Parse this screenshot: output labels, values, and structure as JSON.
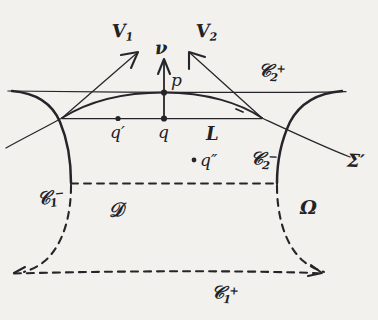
{
  "figure": {
    "kind": "hand-drawn mathematical diagram",
    "background_color": "#f2f1ee",
    "ink_color": "#26262a",
    "width": 378,
    "height": 320
  },
  "vectors": {
    "v1": {
      "label": "V",
      "sub": "1",
      "sup": ""
    },
    "v2": {
      "label": "V",
      "sub": "2",
      "sup": ""
    },
    "nu": {
      "label": "ν",
      "sub": "",
      "sup": ""
    }
  },
  "points": {
    "p": {
      "label": "p",
      "prime": ""
    },
    "q": {
      "label": "q",
      "prime": ""
    },
    "q_prime": {
      "label": "q",
      "prime": "′"
    },
    "q_dprime": {
      "label": "q",
      "prime": "″"
    }
  },
  "curves": {
    "c2_plus": {
      "label": "𝒞",
      "sub": "2",
      "sup": "+"
    },
    "c2_minus": {
      "label": "𝒞",
      "sub": "2",
      "sup": "−"
    },
    "c1_minus": {
      "label": "𝒞",
      "sub": "1",
      "sup": "−"
    },
    "c1_plus": {
      "label": "𝒞",
      "sub": "1",
      "sup": "+"
    },
    "L": {
      "label": "L",
      "sub": "",
      "sup": ""
    },
    "sigma_prime": {
      "label": "Σ",
      "sub": "",
      "sup": "′"
    }
  },
  "regions": {
    "D": {
      "label": "𝒟"
    },
    "Omega": {
      "label": "Ω"
    }
  }
}
